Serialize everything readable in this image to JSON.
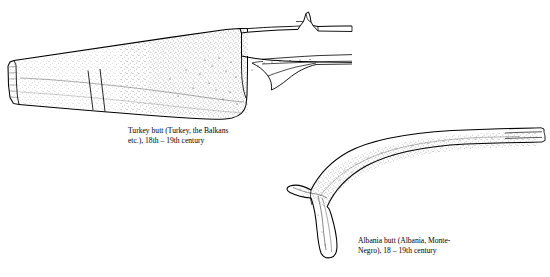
{
  "figure": {
    "type": "line-drawing",
    "items": [
      {
        "id": "turkey-butt",
        "name": "Turkey butt",
        "caption_lines": [
          "Turkey butt (Turkey, the Balkans",
          "etc.), 18th – 19th century"
        ]
      },
      {
        "id": "albania-butt",
        "name": "Albania butt",
        "caption_lines": [
          "Albania butt (Albania, Monte-",
          "Negro), 18 – 19th century"
        ]
      }
    ],
    "colors": {
      "ink": "#000000",
      "background": "#ffffff",
      "stipple": "#2a2a2a"
    }
  }
}
